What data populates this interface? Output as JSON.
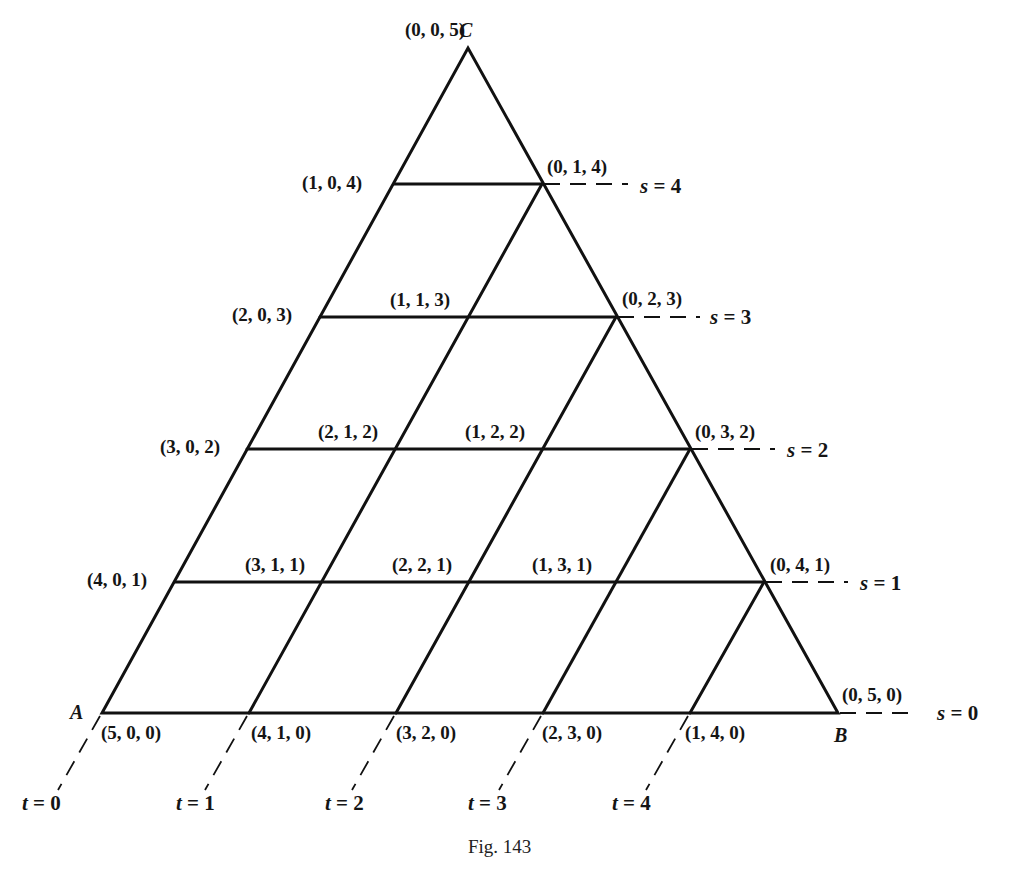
{
  "figure": {
    "caption": "Fig. 143",
    "vertices": {
      "A": "A",
      "B": "B",
      "C": "C"
    },
    "points": [
      {
        "label": "(0, 0, 5)",
        "x": 405,
        "y": 20
      },
      {
        "label": "(1, 0, 4)",
        "x": 302,
        "y": 173
      },
      {
        "label": "(0, 1, 4)",
        "x": 547,
        "y": 157
      },
      {
        "label": "(2, 0, 3)",
        "x": 232,
        "y": 305
      },
      {
        "label": "(1, 1, 3)",
        "x": 390,
        "y": 290
      },
      {
        "label": "(0, 2, 3)",
        "x": 622,
        "y": 289
      },
      {
        "label": "(3, 0, 2)",
        "x": 160,
        "y": 437
      },
      {
        "label": "(2, 1, 2)",
        "x": 318,
        "y": 422
      },
      {
        "label": "(1, 2, 2)",
        "x": 465,
        "y": 422
      },
      {
        "label": "(0, 3, 2)",
        "x": 695,
        "y": 422
      },
      {
        "label": "(4, 0, 1)",
        "x": 87,
        "y": 570
      },
      {
        "label": "(3, 1, 1)",
        "x": 245,
        "y": 555
      },
      {
        "label": "(2, 2, 1)",
        "x": 392,
        "y": 555
      },
      {
        "label": "(1, 3, 1)",
        "x": 532,
        "y": 555
      },
      {
        "label": "(0, 4, 1)",
        "x": 770,
        "y": 555
      },
      {
        "label": "(5, 0, 0)",
        "x": 101,
        "y": 723
      },
      {
        "label": "(4, 1, 0)",
        "x": 251,
        "y": 723
      },
      {
        "label": "(3, 2, 0)",
        "x": 396,
        "y": 723
      },
      {
        "label": "(2, 3, 0)",
        "x": 542,
        "y": 723
      },
      {
        "label": "(1, 4, 0)",
        "x": 685,
        "y": 723
      },
      {
        "label": "(0, 5, 0)",
        "x": 842,
        "y": 685
      }
    ],
    "s_lines": [
      {
        "var": "s",
        "eq": " = 4",
        "x": 640,
        "y": 176
      },
      {
        "var": "s",
        "eq": " = 3",
        "x": 710,
        "y": 307
      },
      {
        "var": "s",
        "eq": " = 2",
        "x": 787,
        "y": 440
      },
      {
        "var": "s",
        "eq": " = 1",
        "x": 860,
        "y": 573
      },
      {
        "var": "s",
        "eq": " = 0",
        "x": 937,
        "y": 703
      }
    ],
    "t_lines": [
      {
        "var": "t",
        "eq": " = 0",
        "x": 22,
        "y": 793
      },
      {
        "var": "t",
        "eq": " = 1",
        "x": 176,
        "y": 793
      },
      {
        "var": "t",
        "eq": " = 2",
        "x": 325,
        "y": 793
      },
      {
        "var": "t",
        "eq": " = 3",
        "x": 468,
        "y": 793
      },
      {
        "var": "t",
        "eq": " = 4",
        "x": 612,
        "y": 793
      }
    ]
  }
}
